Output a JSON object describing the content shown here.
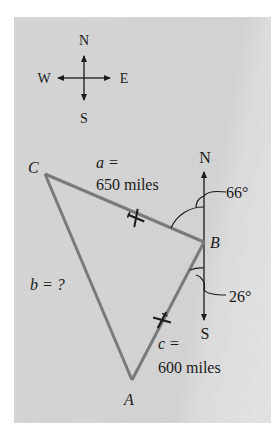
{
  "compass": {
    "north": "N",
    "south": "S",
    "east": "E",
    "west": "W"
  },
  "vertices": {
    "A": "A",
    "B": "B",
    "C": "C"
  },
  "sides": {
    "a": {
      "label_var": "a =",
      "label_value": "650 miles"
    },
    "b": {
      "label": "b = ?"
    },
    "c": {
      "label_var": "c =",
      "label_value": "600 miles"
    }
  },
  "bearing_axis": {
    "north": "N",
    "south": "S"
  },
  "angles": {
    "north_bearing": "66°",
    "south_bearing": "26°"
  },
  "colors": {
    "triangle": "#7a7a7a",
    "panel": "#d3d3d3",
    "ink": "#1a1a1a"
  }
}
